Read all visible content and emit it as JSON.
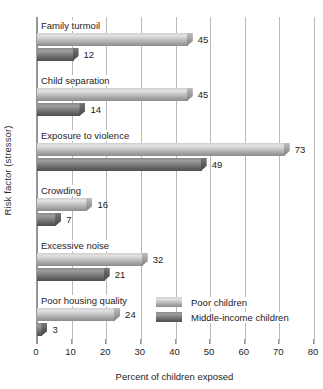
{
  "chart_data": {
    "type": "bar",
    "orientation": "horizontal",
    "title": "",
    "xlabel": "Percent of children exposed",
    "ylabel": "Risk factor (stressor)",
    "xlim": [
      0,
      80
    ],
    "xticks": [
      0,
      10,
      20,
      30,
      40,
      50,
      60,
      70,
      80
    ],
    "grid": "vertical",
    "legend_position": "inside-bottom-right",
    "categories": [
      "Family turmoil",
      "Child separation",
      "Exposure to violence",
      "Crowding",
      "Excessive noise",
      "Poor housing quality"
    ],
    "series": [
      {
        "name": "Poor children",
        "color": "#bfbfbf",
        "values": [
          45,
          45,
          73,
          16,
          32,
          24
        ]
      },
      {
        "name": "Middle-income children",
        "color": "#6e6e6e",
        "values": [
          12,
          14,
          49,
          7,
          21,
          3
        ]
      }
    ]
  },
  "axis": {
    "y_title": "Risk factor (stressor)",
    "x_title": "Percent of children exposed",
    "x_tick_labels": [
      "0",
      "10",
      "20",
      "30",
      "40",
      "50",
      "60",
      "70",
      "80"
    ]
  },
  "groups": [
    {
      "label": "Family turmoil",
      "bars": [
        {
          "value": 45,
          "label": "45",
          "series": "Poor children"
        },
        {
          "value": 12,
          "label": "12",
          "series": "Middle-income children"
        }
      ]
    },
    {
      "label": "Child separation",
      "bars": [
        {
          "value": 45,
          "label": "45",
          "series": "Poor children"
        },
        {
          "value": 14,
          "label": "14",
          "series": "Middle-income children"
        }
      ]
    },
    {
      "label": "Exposure to violence",
      "bars": [
        {
          "value": 73,
          "label": "73",
          "series": "Poor children"
        },
        {
          "value": 49,
          "label": "49",
          "series": "Middle-income children"
        }
      ]
    },
    {
      "label": "Crowding",
      "bars": [
        {
          "value": 16,
          "label": "16",
          "series": "Poor children"
        },
        {
          "value": 7,
          "label": "7",
          "series": "Middle-income children"
        }
      ]
    },
    {
      "label": "Excessive noise",
      "bars": [
        {
          "value": 32,
          "label": "32",
          "series": "Poor children"
        },
        {
          "value": 21,
          "label": "21",
          "series": "Middle-income children"
        }
      ]
    },
    {
      "label": "Poor housing quality",
      "bars": [
        {
          "value": 24,
          "label": "24",
          "series": "Poor children"
        },
        {
          "value": 3,
          "label": "3",
          "series": "Middle-income children"
        }
      ]
    }
  ],
  "legend": {
    "items": [
      {
        "label": "Poor children",
        "swatch": "light"
      },
      {
        "label": "Middle-income children",
        "swatch": "dark"
      }
    ]
  }
}
